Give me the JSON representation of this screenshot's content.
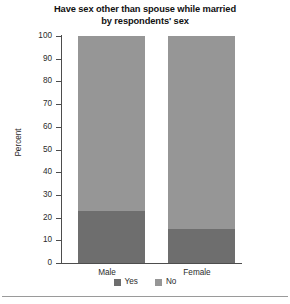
{
  "chart_data": {
    "type": "bar",
    "subtype": "stacked-100-percent",
    "title": "Have sex other than spouse while married by respondents' sex",
    "title_lines": [
      "Have sex other than spouse while married",
      "by respondents' sex"
    ],
    "xlabel": "",
    "ylabel": "Percent",
    "categories": [
      "Male",
      "Female"
    ],
    "ylim": [
      0,
      100
    ],
    "yticks": [
      0,
      10,
      20,
      30,
      40,
      50,
      60,
      70,
      80,
      90,
      100
    ],
    "grid": false,
    "legend_position": "bottom",
    "series": [
      {
        "name": "Yes",
        "color": "#6e6e6e",
        "values": [
          23,
          15
        ]
      },
      {
        "name": "No",
        "color": "#969696",
        "values": [
          77,
          85
        ]
      }
    ]
  },
  "colors": {
    "yes": "#6e6e6e",
    "no": "#969696",
    "axis": "#4d4d4d",
    "text": "#2b2b2b",
    "title": "#111111",
    "rule": "#9a9a9a",
    "background": "#ffffff"
  }
}
